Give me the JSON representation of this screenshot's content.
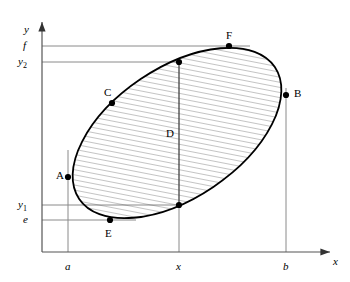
{
  "figure": {
    "kind": "geometry-diagram",
    "colors": {
      "curve": "#000000",
      "guide_line": "#808080",
      "axis": "#666666",
      "hatch": "#555555",
      "background": "#ffffff"
    }
  },
  "axes": {
    "x_label": "x",
    "y_label": "y",
    "x_ticks": [
      {
        "label": "a",
        "x": 68
      },
      {
        "label": "x",
        "x": 179
      },
      {
        "label": "b",
        "x": 286
      }
    ],
    "y_ticks": [
      {
        "label": "f",
        "sub": "",
        "y": 46
      },
      {
        "label": "y",
        "sub": "2",
        "y": 62
      },
      {
        "label": "y",
        "sub": "1",
        "y": 205
      },
      {
        "label": "e",
        "sub": "",
        "y": 220
      }
    ]
  },
  "points": [
    {
      "id": "A",
      "label": "A",
      "cx": 68,
      "cy": 177,
      "label_x": 56,
      "label_y": 170
    },
    {
      "id": "B",
      "label": "B",
      "cx": 286,
      "cy": 95,
      "label_x": 294,
      "label_y": 88
    },
    {
      "id": "C",
      "label": "C",
      "cx": 112,
      "cy": 103,
      "label_x": 104,
      "label_y": 88
    },
    {
      "id": "F",
      "label": "F",
      "cx": 229,
      "cy": 46,
      "label_x": 226,
      "label_y": 31
    },
    {
      "id": "E",
      "label": "E",
      "cx": 110,
      "cy": 220,
      "label_x": 105,
      "label_y": 228
    },
    {
      "id": "P2",
      "label": "",
      "cx": 179,
      "cy": 62,
      "label_x": 0,
      "label_y": 0
    },
    {
      "id": "P1",
      "label": "",
      "cx": 179,
      "cy": 205,
      "label_x": 0,
      "label_y": 0
    }
  ],
  "chord": {
    "label": "D",
    "label_x": 166,
    "label_y": 128
  }
}
